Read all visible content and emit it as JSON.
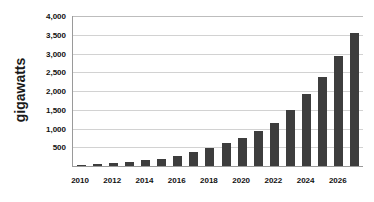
{
  "chart_data": {
    "type": "bar",
    "title": "",
    "subtitle": "",
    "xlabel": "",
    "ylabel": "gigawatts",
    "ylim": [
      0,
      4000
    ],
    "xlim_categories": [
      "2010",
      "2027"
    ],
    "grid": true,
    "legend": null,
    "y_ticks": [
      {
        "value": 4000,
        "label": "4,000"
      },
      {
        "value": 3500,
        "label": "3,500"
      },
      {
        "value": 3000,
        "label": "3,000"
      },
      {
        "value": 2500,
        "label": "2,500"
      },
      {
        "value": 2000,
        "label": "2,000"
      },
      {
        "value": 1500,
        "label": "1,500"
      },
      {
        "value": 1000,
        "label": "1,000"
      },
      {
        "value": 500,
        "label": "500"
      }
    ],
    "x_tick_labels": [
      "2010",
      "",
      "2012",
      "",
      "2014",
      "",
      "2016",
      "",
      "2018",
      "",
      "2020",
      "",
      "2022",
      "",
      "2024",
      "",
      "2026",
      ""
    ],
    "categories": [
      "2010",
      "2011",
      "2012",
      "2013",
      "2014",
      "2015",
      "2016",
      "2017",
      "2018",
      "2019",
      "2020",
      "2021",
      "2022",
      "2023",
      "2024",
      "2025",
      "2026",
      "2027"
    ],
    "values": [
      30,
      55,
      80,
      115,
      150,
      195,
      265,
      370,
      470,
      610,
      745,
      925,
      1155,
      1500,
      1910,
      2370,
      2930,
      3560
    ],
    "bar_color": "#3d3d3d",
    "gridline_color": "#d2d2d2",
    "axis_color": "#9a9a9a",
    "background_color": "#ffffff"
  }
}
